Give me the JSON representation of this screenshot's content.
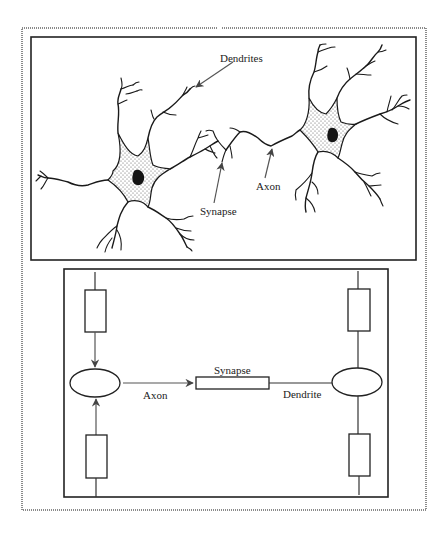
{
  "figure": {
    "top_panel": {
      "title": "Biological neurons",
      "labels": {
        "dendrites": "Dendrites",
        "synapse": "Synapse",
        "axon": "Axon"
      }
    },
    "bottom_panel": {
      "title": "Schematic model",
      "labels": {
        "synapse": "Synapse",
        "axon": "Axon",
        "dendrite": "Dendrite"
      }
    }
  },
  "colors": {
    "ink": "#1a1a1a",
    "border_dotted": "#8a8a8a",
    "background": "#ffffff"
  }
}
